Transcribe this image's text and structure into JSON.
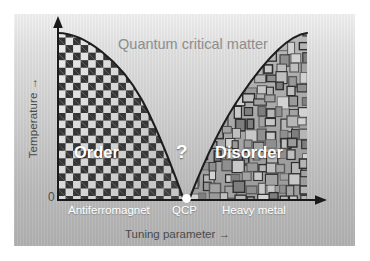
{
  "figure": {
    "type": "phase-diagram-schematic",
    "background_color": "#c6c6c6",
    "panel_color_top": "#f2f2f2",
    "panel_color_bottom": "#b2b2b2"
  },
  "axes": {
    "y_label": "Temperature →",
    "y_zero_tick": "0",
    "x_label": "Tuning parameter →",
    "axis_color": "#1a1a1a"
  },
  "regions": [
    {
      "id": "order",
      "label": "Order",
      "texture": "checkerboard",
      "label_color": "#ffffff"
    },
    {
      "id": "quantum-critical",
      "label": "Quantum critical matter",
      "texture": "plain-gradient",
      "label_color": "#8d8d8d"
    },
    {
      "id": "disorder",
      "label": "Disorder",
      "texture": "irregular-mosaic",
      "label_color": "#ffffff"
    }
  ],
  "center_marker": {
    "question_label": "?",
    "point_label": "QCP",
    "point_color": "#ffffff"
  },
  "x_axis_annotations": [
    {
      "label": "Antiferromagnet"
    },
    {
      "label": "QCP"
    },
    {
      "label": "Heavy  metal"
    }
  ],
  "chart_data": {
    "type": "area",
    "title": "",
    "xlabel": "Tuning parameter →",
    "ylabel": "Temperature →",
    "xlim": [
      0,
      1
    ],
    "ylim": [
      0,
      1
    ],
    "grid": false,
    "legend": "none",
    "ytick_labels": [
      "0"
    ],
    "xtick_labels": [
      "Antiferromagnet",
      "QCP",
      "Heavy  metal"
    ],
    "annotations": [
      {
        "text": "Quantum critical matter",
        "x": 0.5,
        "y": 0.88,
        "color": "#8d8d8d"
      },
      {
        "text": "Order",
        "x": 0.18,
        "y": 0.33,
        "color": "#ffffff"
      },
      {
        "text": "?",
        "x": 0.5,
        "y": 0.34,
        "color": "#ffffff"
      },
      {
        "text": "Disorder",
        "x": 0.76,
        "y": 0.33,
        "color": "#ffffff"
      }
    ],
    "series": [
      {
        "name": "Antiferromagnetic order boundary",
        "kind": "boundary-curve",
        "x": [
          0.0,
          0.08,
          0.16,
          0.24,
          0.32,
          0.4,
          0.46,
          0.5
        ],
        "y": [
          1.0,
          0.93,
          0.8,
          0.63,
          0.44,
          0.25,
          0.1,
          0.0
        ]
      },
      {
        "name": "Heavy-metal coherence boundary",
        "kind": "boundary-curve",
        "x": [
          0.5,
          0.55,
          0.61,
          0.68,
          0.76,
          0.85,
          0.93,
          1.0
        ],
        "y": [
          0.0,
          0.12,
          0.28,
          0.46,
          0.63,
          0.8,
          0.93,
          1.0
        ]
      }
    ],
    "points": [
      {
        "name": "QCP",
        "x": 0.5,
        "y": 0.0,
        "color": "#ffffff"
      }
    ]
  }
}
